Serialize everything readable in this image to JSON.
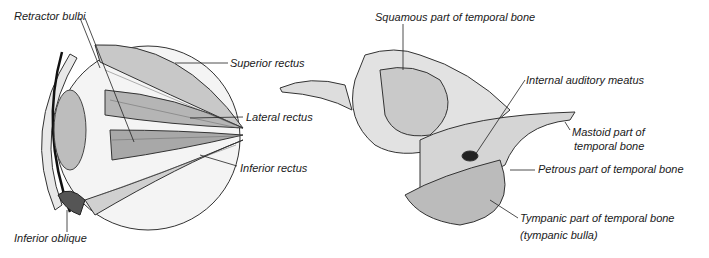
{
  "eye_figure": {
    "labels": {
      "retractor_bulbi": "Retractor bulbi",
      "superior_rectus": "Superior rectus",
      "lateral_rectus": "Lateral rectus",
      "inferior_rectus": "Inferior rectus",
      "inferior_oblique": "Inferior oblique"
    }
  },
  "bone_figure": {
    "labels": {
      "squamous": "Squamous part of temporal bone",
      "internal_auditory": "Internal auditory meatus",
      "mastoid_line1": "Mastoid part of",
      "mastoid_line2": "temporal bone",
      "petrous": "Petrous part of temporal bone",
      "tympanic_line1": "Tympanic part of temporal bone",
      "tympanic_line2": "(tympanic bulla)"
    }
  }
}
